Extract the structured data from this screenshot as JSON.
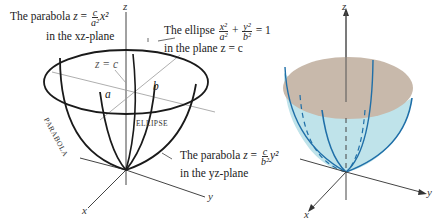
{
  "left_figure": {
    "labels": {
      "parabola_xz": {
        "prefix": "The parabola ",
        "lhs": "z",
        "eq": " = ",
        "num": "c",
        "den": "a²",
        "var": "x²",
        "line2": "in the xz-plane"
      },
      "ellipse": {
        "prefix": "The ellipse ",
        "t1_num": "x²",
        "t1_den": "a²",
        "plus": " + ",
        "t2_num": "y²",
        "t2_den": "b²",
        "rhs": " = 1",
        "line2": "in the plane z = c"
      },
      "parabola_yz": {
        "prefix": "The parabola ",
        "lhs": "z",
        "eq": " = ",
        "num": "c",
        "den": "b²",
        "var": "y²",
        "line2": "in the yz-plane"
      },
      "z_eq_c": "z = c",
      "a": "a",
      "b": "b",
      "parabola_side": "PARABOLA",
      "ellipse_inside": "ELLIPSE"
    },
    "axes": {
      "x": "x",
      "y": "y",
      "z": "z"
    }
  },
  "right_figure": {
    "axes": {
      "x": "x",
      "y": "y",
      "z": "z"
    },
    "colors": {
      "surface": "#bfe3ea",
      "top_face": "#c8b9ab",
      "curves": "#1f6fa8",
      "axis": "#333333"
    }
  }
}
